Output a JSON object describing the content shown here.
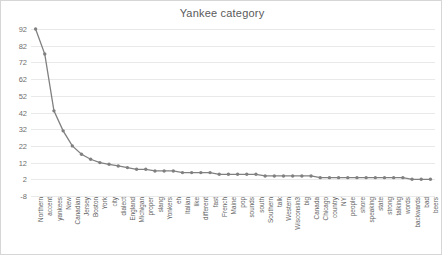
{
  "chart_data": {
    "type": "line",
    "title": "Yankee category",
    "xlabel": "",
    "ylabel": "",
    "ylim": [
      -8,
      92
    ],
    "yticks": [
      -8,
      2,
      12,
      22,
      32,
      42,
      52,
      62,
      72,
      82,
      92
    ],
    "grid": true,
    "legend": false,
    "marker": "circle",
    "line_color": "#808080",
    "grid_color": "#e9e9e9",
    "categories": [
      "Northern",
      "accent",
      "yankees",
      "New",
      "Canadian",
      "Jersey",
      "Boston",
      "York",
      "city",
      "dialect",
      "England",
      "Michigan",
      "proper",
      "slang",
      "Yonkers",
      "eh",
      "Italian",
      "like",
      "different",
      "fast",
      "French",
      "Maine",
      "pop",
      "sounds",
      "south",
      "Southern",
      "talk",
      "Western",
      "Wisconsin3",
      "big",
      "Canada",
      "Chicago",
      "country",
      "NY",
      "people",
      "shore",
      "speaking",
      "state",
      "strong",
      "talking",
      "words",
      "backwards",
      "bad",
      "beers"
    ],
    "values": [
      92,
      77,
      43,
      31,
      22,
      17,
      14,
      12,
      11,
      10,
      9,
      8,
      8,
      7,
      7,
      7,
      6,
      6,
      6,
      6,
      5,
      5,
      5,
      5,
      5,
      4,
      4,
      4,
      4,
      4,
      4,
      3,
      3,
      3,
      3,
      3,
      3,
      3,
      3,
      3,
      3,
      2,
      2,
      2
    ]
  }
}
